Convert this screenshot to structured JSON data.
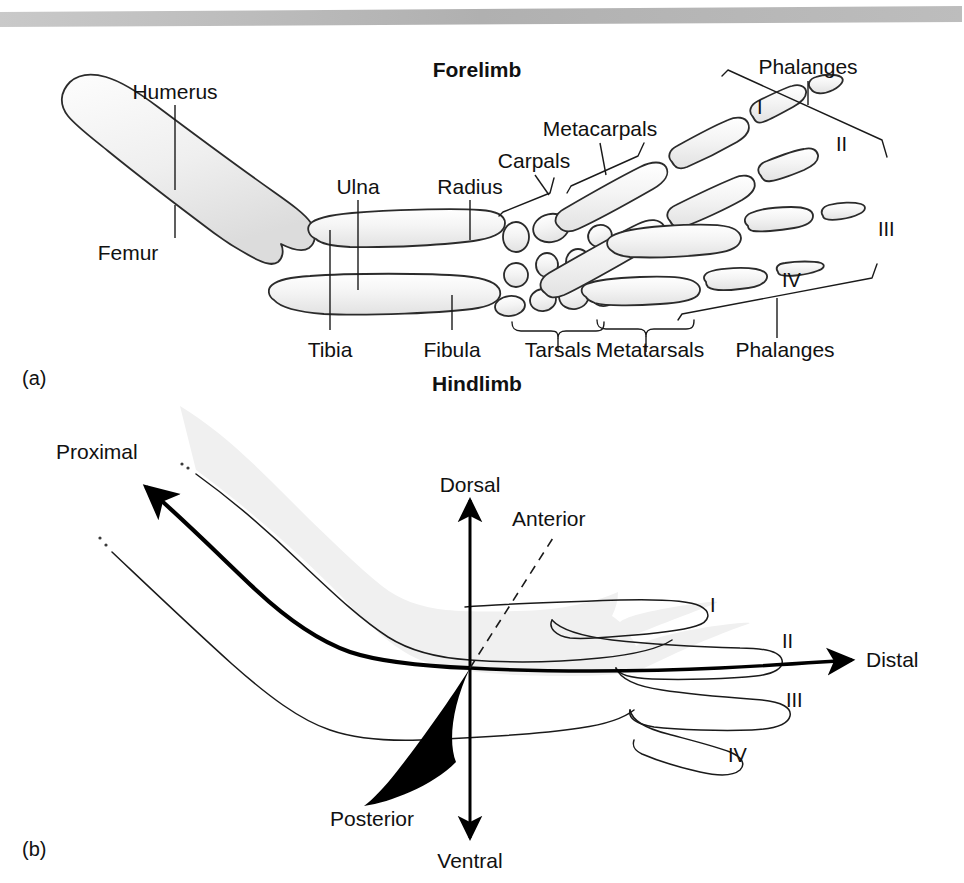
{
  "figure": {
    "top_rule": {
      "name": "header-rule",
      "color": "#b4b4b4"
    },
    "panel_a": {
      "panel_label": "(a)",
      "title_top": "Forelimb",
      "title_bottom": "Hindlimb",
      "forelimb_labels": [
        "Humerus",
        "Ulna",
        "Radius",
        "Carpals",
        "Metacarpals",
        "Phalanges"
      ],
      "hindlimb_labels": [
        "Femur",
        "Tibia",
        "Fibula",
        "Tarsals",
        "Metatarsals",
        "Phalanges"
      ],
      "digit_labels": [
        "I",
        "II",
        "III",
        "IV"
      ],
      "bone_fill": "#f2f2f2",
      "bone_stroke": "#2b2b2b"
    },
    "panel_b": {
      "panel_label": "(b)",
      "axis_labels": {
        "proximal": "Proximal",
        "distal": "Distal",
        "dorsal": "Dorsal",
        "ventral": "Ventral",
        "anterior": "Anterior",
        "posterior": "Posterior"
      },
      "digit_labels": [
        "I",
        "II",
        "III",
        "IV"
      ],
      "limb_fill": "#f0f0f0",
      "limb_stroke": "#1a1a1a"
    }
  }
}
